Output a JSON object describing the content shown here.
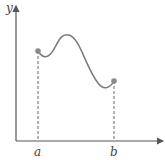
{
  "diagram": {
    "axis_labels": {
      "y": "y",
      "x": "x"
    },
    "points": [
      {
        "label": "a",
        "x": 38,
        "y": 51
      },
      {
        "label": "b",
        "x": 114,
        "y": 81
      }
    ],
    "colors": {
      "axes": "#555555",
      "curve": "#7a7a7a",
      "points": "#8a8a8a",
      "dashes": "#666666"
    }
  }
}
